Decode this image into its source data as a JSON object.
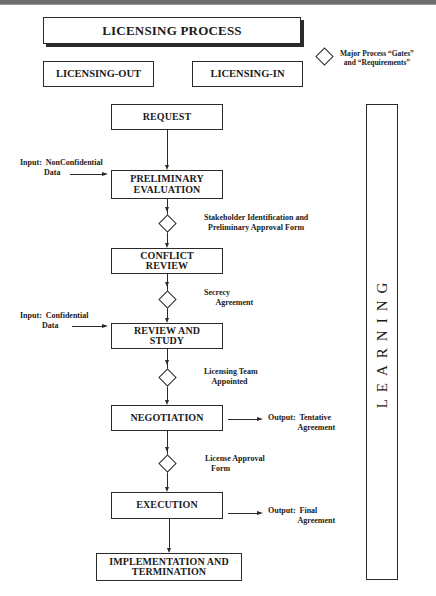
{
  "title": "LICENSING PROCESS",
  "categories": [
    "LICENSING-OUT",
    "LICENSING-IN"
  ],
  "legend": {
    "icon": "diamond-icon",
    "text": "Major Process “Gates”\n  and “Requirements”"
  },
  "steps": [
    "REQUEST",
    "PRELIMINARY\nEVALUATION",
    "CONFLICT\nREVIEW",
    "REVIEW AND\nSTUDY",
    "NEGOTIATION",
    "EXECUTION",
    "IMPLEMENTATION AND\nTERMINATION"
  ],
  "gates": [
    "Stakeholder Identification and\n  Preliminary Approval Form",
    "Secrecy\n      Agreement",
    "Licensing Team\n    Appointed",
    "License Approval\n   Form"
  ],
  "inputs": [
    "Input:  NonConfidential\n            Data",
    "Input:  Confidential\n           Data"
  ],
  "outputs": [
    "Output:  Tentative\n               Agreement",
    "Output:  Final\n               Agreement"
  ],
  "sidebar": {
    "label": "LEARNING"
  }
}
